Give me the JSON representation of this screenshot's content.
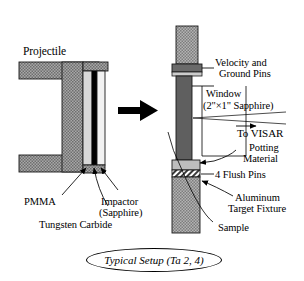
{
  "figure": {
    "caption": "Typical Setup (Ta 2, 4)",
    "type": "technical-cross-section-diagram"
  },
  "left_assembly": {
    "title": "Projectile",
    "labels": {
      "pmma": "PMMA",
      "impactor_line1": "Impactor",
      "impactor_line2": "(Sapphire)",
      "tungsten_carbide": "Tungsten Carbide"
    }
  },
  "center": {
    "arrow": "impact-direction-arrow"
  },
  "right_assembly": {
    "labels": {
      "velocity_pins_line1": "Velocity and",
      "velocity_pins_line2": "Ground Pins",
      "window_line1": "Window",
      "window_line2": "(2\"×1\" Sapphire)",
      "to_visar": "To VISAR",
      "potting_line1": "Potting",
      "potting_line2": "Material",
      "flush_pins": "4 Flush Pins",
      "fixture_line1": "Aluminum",
      "fixture_line2": "Target Fixture",
      "sample": "Sample"
    }
  },
  "colors": {
    "body_gray": "#9a9a9a",
    "hatch_gray": "#8d8d8d",
    "light_gray": "#d2d2d2",
    "pale_gray": "#e6e6e6",
    "dark_gray": "#6f6f6f",
    "black": "#000000",
    "white": "#ffffff",
    "outline": "#1a1a1a"
  }
}
